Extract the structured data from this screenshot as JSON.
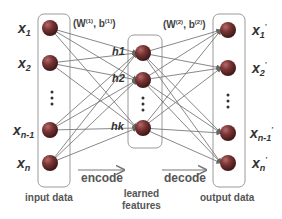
{
  "diagram": {
    "colors": {
      "node": "#6e2f2f",
      "node_highlight": "#b36a6a",
      "box_stroke": "#9a9a9a",
      "edge": "#7a7a7a",
      "text": "#333333"
    },
    "input_layer": {
      "caption": "input data",
      "nodes": [
        {
          "base": "x",
          "sub": "1",
          "sup": ""
        },
        {
          "base": "x",
          "sub": "2",
          "sup": ""
        },
        {
          "base": "⋮",
          "sub": "",
          "sup": ""
        },
        {
          "base": "x",
          "sub": "n-1",
          "sup": ""
        },
        {
          "base": "x",
          "sub": "n",
          "sup": ""
        }
      ]
    },
    "hidden_layer": {
      "caption_line1": "learned",
      "caption_line2": "features",
      "nodes": [
        {
          "label": "h1"
        },
        {
          "label": "h2"
        },
        {
          "label": "⋮"
        },
        {
          "label": "hk"
        }
      ]
    },
    "output_layer": {
      "caption": "output data",
      "nodes": [
        {
          "base": "x",
          "sub": "1",
          "sup": "'"
        },
        {
          "base": "x",
          "sub": "2",
          "sup": "'"
        },
        {
          "base": "⋮",
          "sub": "",
          "sup": ""
        },
        {
          "base": "x",
          "sub": "n-1",
          "sup": "'"
        },
        {
          "base": "x",
          "sub": "n",
          "sup": "'"
        }
      ]
    },
    "encoder_params": {
      "open": "(W",
      "sup1": "(1)",
      "mid": ", b",
      "sup2": "(1)",
      "close": ")"
    },
    "decoder_params": {
      "open": "(W",
      "sup1": "(2)",
      "mid": ", b",
      "sup2": "(2)",
      "close": ")"
    },
    "encode_label": "encode",
    "decode_label": "decode"
  }
}
